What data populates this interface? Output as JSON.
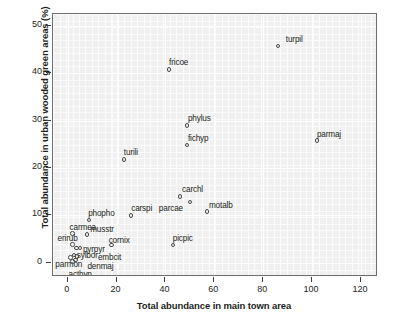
{
  "chart_data": {
    "type": "scatter",
    "title": "",
    "xlabel": "Total abundance in main town area",
    "ylabel": "Total abundance in urban wooded green areas (%)",
    "xlim": [
      -6,
      127
    ],
    "ylim": [
      -3,
      52.5
    ],
    "xticks": [
      0,
      20,
      40,
      60,
      80,
      100,
      120
    ],
    "yticks": [
      0,
      10,
      20,
      30,
      40,
      50
    ],
    "grid": true,
    "legend": "none",
    "points": [
      {
        "label": "turpil",
        "x": 86,
        "y": 45.8,
        "lx": 8,
        "ly": -11
      },
      {
        "label": "fricoe",
        "x": 41.5,
        "y": 40.8,
        "lx": 0,
        "ly": -11
      },
      {
        "label": "phylus",
        "x": 48.8,
        "y": 29.0,
        "lx": 1,
        "ly": -11
      },
      {
        "label": "fichyp",
        "x": 48.8,
        "y": 24.8,
        "lx": 1,
        "ly": -11
      },
      {
        "label": "parmaj",
        "x": 102,
        "y": 25.8,
        "lx": 0,
        "ly": -11
      },
      {
        "label": "turili",
        "x": 23,
        "y": 21.8,
        "lx": 0,
        "ly": -11
      },
      {
        "label": "carchl",
        "x": 46,
        "y": 14.0,
        "lx": 2,
        "ly": -11
      },
      {
        "label": "parcae",
        "x": 50,
        "y": 12.8,
        "lx": -31,
        "ly": 2
      },
      {
        "label": "motalb",
        "x": 57,
        "y": 10.8,
        "lx": 2,
        "ly": -11
      },
      {
        "label": "carspi",
        "x": 26,
        "y": 10.0,
        "lx": 0,
        "ly": -11
      },
      {
        "label": "phopho",
        "x": 8.8,
        "y": 9.0,
        "lx": -1,
        "ly": -11
      },
      {
        "label": "carmea",
        "x": 2,
        "y": 6.2,
        "lx": -3,
        "ly": -10
      },
      {
        "label": "musstr",
        "x": 8,
        "y": 6.0,
        "lx": 3,
        "ly": -9
      },
      {
        "label": "picpic",
        "x": 43,
        "y": 3.8,
        "lx": 0,
        "ly": -11
      },
      {
        "label": "erirub",
        "x": 2,
        "y": 3.9,
        "lx": -15,
        "ly": -10
      },
      {
        "label": "cornix",
        "x": 18,
        "y": 3.8,
        "lx": -3,
        "ly": -9
      },
      {
        "label": "pyrpyr",
        "x": 5,
        "y": 3.1,
        "lx": 3,
        "ly": -3
      },
      {
        "label": "",
        "x": 3.6,
        "y": 3.1,
        "lx": 0,
        "ly": 0
      },
      {
        "label": "sylbor",
        "x": 2.5,
        "y": 1.6,
        "lx": 3,
        "ly": -4
      },
      {
        "label": "embcit",
        "x": 3.8,
        "y": 1.3,
        "lx": 21,
        "ly": -4
      },
      {
        "label": "parmon",
        "x": 1.1,
        "y": 1.1,
        "lx": -15,
        "ly": 2
      },
      {
        "label": "denmaj",
        "x": 3.2,
        "y": 0.6,
        "lx": 12,
        "ly": 2
      },
      {
        "label": "acthyp",
        "x": 2.0,
        "y": 0.3,
        "lx": -4,
        "ly": 9
      }
    ]
  },
  "colors": {
    "panel_background": "#f0f0f0",
    "grid_line": "#ffffff",
    "frame": "#6d6d6d",
    "marker_stroke": "#4a4a4a",
    "text": "#231f20"
  }
}
